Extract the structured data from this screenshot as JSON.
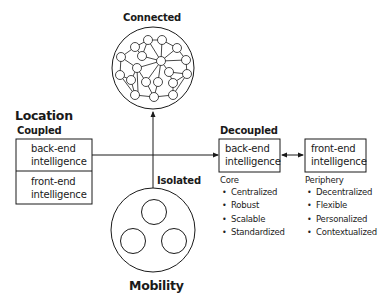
{
  "labels": {
    "connected": "Connected",
    "isolated": "Isolated",
    "location": "Location",
    "coupled": "Coupled",
    "decoupled": "Decoupled",
    "mobility": "Mobility"
  },
  "coupled_box": {
    "top_line1": "back-end",
    "top_line2": "intelligence",
    "bottom_line1": "front-end",
    "bottom_line2": "intelligence"
  },
  "decoupled_back_box": {
    "line1": "back-end",
    "line2": "intelligence"
  },
  "decoupled_front_box": {
    "line1": "front-end",
    "line2": "intelligence"
  },
  "core": {
    "caption": "Core",
    "items": [
      "Centralized",
      "Robust",
      "Scalable",
      "Standardized"
    ]
  },
  "periphery": {
    "caption": "Periphery",
    "items": [
      "Decentralized",
      "Flexible",
      "Personalized",
      "Contextualized"
    ]
  }
}
